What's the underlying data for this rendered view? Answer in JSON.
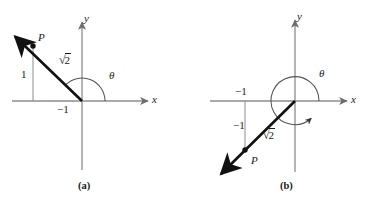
{
  "figure": {
    "type": "math-diagram",
    "colors": {
      "axis": "#8c8c8c",
      "vector": "#111111",
      "arc": "#555555",
      "guide": "#8c8c8c",
      "text": "#1a1a1a",
      "background": "#ffffff"
    }
  },
  "panel_a": {
    "caption": "(a)",
    "axis_x_label": "x",
    "axis_y_label": "y",
    "point_label": "P",
    "magnitude_label": {
      "symbol": "√",
      "argument": "2"
    },
    "x_coordinate_label": "−1",
    "y_coordinate_label": "1",
    "angle_label": "θ",
    "point": {
      "x": -1,
      "y": 1
    },
    "magnitude": "√2",
    "angle_degrees": 135
  },
  "panel_b": {
    "caption": "(b)",
    "axis_x_label": "x",
    "axis_y_label": "y",
    "point_label": "P",
    "magnitude_label": {
      "symbol": "√",
      "argument": "2"
    },
    "x_coordinate_label": "−1",
    "y_coordinate_label": "−1",
    "angle_label": "θ",
    "point": {
      "x": -1,
      "y": -1
    },
    "magnitude": "√2",
    "angle_degrees": 225
  }
}
